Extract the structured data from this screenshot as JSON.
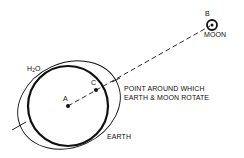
{
  "diagram": {
    "labels": {
      "point_b": "B",
      "moon": "MOON",
      "water_prefix": "H",
      "water_sub": "2",
      "water_suffix": "O",
      "point_c": "C",
      "point_a": "A",
      "barycenter_line1": "POINT AROUND WHICH",
      "barycenter_line2": "EARTH & MOON ROTATE",
      "earth": "EARTH"
    },
    "colors": {
      "ink": "#111111",
      "background": "#ffffff"
    }
  }
}
